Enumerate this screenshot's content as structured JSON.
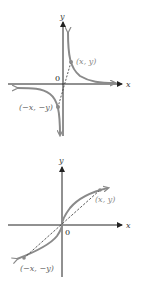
{
  "colors": {
    "axis": "#222222",
    "curve": "#8a8a8a",
    "point": "#8a8a8a",
    "dashed": "#333333",
    "label_gray": "#888888",
    "label_dark": "#444444"
  },
  "graphs": [
    {
      "name": "hyperbola-odd-function",
      "x_axis_label": "x",
      "y_axis_label": "y",
      "origin_label": "0",
      "point_label": "(x, y)",
      "neg_point_label": "(−x, −y)"
    },
    {
      "name": "cubic-root-odd-function",
      "x_axis_label": "x",
      "y_axis_label": "y",
      "origin_label": "0",
      "point_label": "(x, y)",
      "neg_point_label": "(−x, −y)"
    }
  ]
}
